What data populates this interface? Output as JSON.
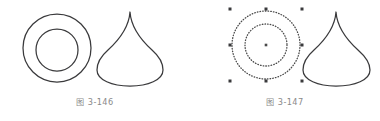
{
  "document": {
    "type": "scanned-textbook-figure-pair",
    "background_color": "#ffffff",
    "stroke_color": "#3a3a3c",
    "caption_color": "#8a8a8a",
    "selection_color": "#4a4a4a"
  },
  "figures": [
    {
      "id": "figure-146",
      "caption": "图 3-146",
      "shapes": [
        {
          "name": "annulus",
          "type": "concentric-circles",
          "outer_cx": 57,
          "outer_cy": 48,
          "outer_rx": 34,
          "outer_ry": 34,
          "inner_cx": 57,
          "inner_cy": 50,
          "inner_rx": 21,
          "inner_ry": 21,
          "selected": false
        },
        {
          "name": "teardrop",
          "type": "teardrop-outline",
          "apex_x": 130,
          "apex_y": 12,
          "bottom_y": 86,
          "left_x": 97,
          "right_x": 163,
          "selected": false
        }
      ]
    },
    {
      "id": "figure-147",
      "caption": "图 3-147",
      "shapes": [
        {
          "name": "annulus",
          "type": "concentric-circles",
          "outer_cx": 76,
          "outer_cy": 45,
          "outer_rx": 34,
          "outer_ry": 34,
          "inner_cx": 76,
          "inner_cy": 45,
          "inner_rx": 21,
          "inner_ry": 21,
          "selected": true,
          "selection": {
            "style": "dotted",
            "center_marker": true,
            "handle_count": 8,
            "handle_size": 3,
            "bbox_x": 40,
            "bbox_y": 9,
            "bbox_w": 72,
            "bbox_h": 72
          }
        },
        {
          "name": "teardrop",
          "type": "teardrop-outline",
          "apex_x": 146,
          "apex_y": 12,
          "bottom_y": 86,
          "left_x": 113,
          "right_x": 180,
          "selected": false
        }
      ]
    }
  ]
}
